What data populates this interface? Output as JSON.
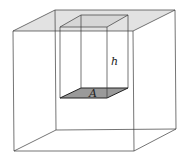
{
  "figure": {
    "labels": {
      "height": "h",
      "area": "A"
    },
    "colors": {
      "top_surface_fill": "#e2e2e2",
      "base_fill": "#9a9a9a",
      "edge": "#3a3a3a"
    }
  }
}
